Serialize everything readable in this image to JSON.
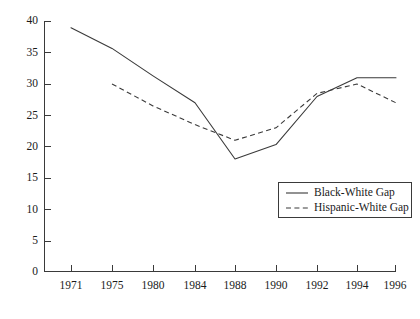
{
  "chart_data": {
    "type": "line",
    "title": "",
    "subtitle": "",
    "xlabel": "",
    "ylabel": "",
    "categories": [
      "1971",
      "1975",
      "1980",
      "1984",
      "1988",
      "1990",
      "1992",
      "1994",
      "1996"
    ],
    "x": [
      1971,
      1975,
      1980,
      1984,
      1988,
      1990,
      1992,
      1994,
      1996
    ],
    "xlim": [
      1971,
      1996
    ],
    "ylim": [
      0,
      40
    ],
    "y_ticks": [
      0,
      5,
      10,
      15,
      20,
      25,
      30,
      35,
      40
    ],
    "y_tick_labels": [
      "0",
      "5",
      "10",
      "15",
      "20",
      "25",
      "30",
      "35",
      "40"
    ],
    "x_tick_labels": [
      "1971",
      "1975",
      "1980",
      "1984",
      "1988",
      "1990",
      "1992",
      "1994",
      "1996"
    ],
    "grid": false,
    "legend_position": "center-right",
    "series": [
      {
        "name": "Black-White Gap",
        "style": "solid",
        "color": "#3a3a3a",
        "x": [
          1971,
          1975,
          1980,
          1984,
          1988,
          1990,
          1992,
          1994,
          1996
        ],
        "values": [
          39,
          35.7,
          31.3,
          27,
          18,
          20.3,
          28,
          31,
          31
        ]
      },
      {
        "name": "Hispanic-White Gap",
        "style": "dashed",
        "color": "#3a3a3a",
        "x": [
          1975,
          1980,
          1984,
          1988,
          1990,
          1992,
          1994,
          1996
        ],
        "values": [
          30,
          26.5,
          23.5,
          21,
          23,
          28.5,
          30,
          27
        ]
      }
    ],
    "legend": [
      {
        "label": "Black-White Gap",
        "style": "solid"
      },
      {
        "label": "Hispanic-White Gap",
        "style": "dashed"
      }
    ]
  },
  "axis": {
    "y_labels": [
      "40",
      "35",
      "30",
      "25",
      "20",
      "15",
      "10",
      "5",
      "0"
    ],
    "x_labels": [
      "1971",
      "1975",
      "1980",
      "1984",
      "1988",
      "1990",
      "1992",
      "1994",
      "1996"
    ]
  },
  "legend": {
    "items": [
      {
        "label": "Black-White Gap"
      },
      {
        "label": "Hispanic-White Gap"
      }
    ]
  },
  "colors": {
    "line": "#3a3a3a",
    "axis": "#3a3a3a",
    "text": "#1a1a1a",
    "background": "#ffffff"
  }
}
